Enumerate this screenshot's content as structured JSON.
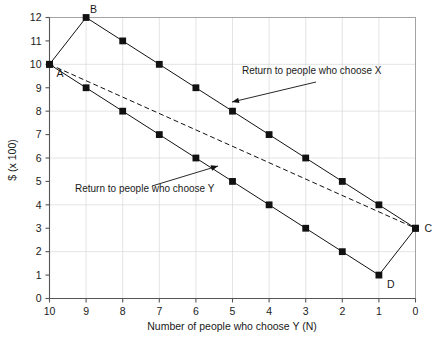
{
  "chart_data": {
    "type": "line",
    "title": "",
    "xlabel": "Number of people who choose Y (N)",
    "ylabel": "$ (x 100)",
    "xlim": [
      10,
      0
    ],
    "ylim": [
      0,
      12
    ],
    "x_ticks": [
      "10",
      "9",
      "8",
      "7",
      "6",
      "5",
      "4",
      "3",
      "2",
      "1",
      "0"
    ],
    "y_ticks": [
      "0",
      "1",
      "2",
      "3",
      "4",
      "5",
      "6",
      "7",
      "8",
      "9",
      "10",
      "11",
      "12"
    ],
    "x_axis_reversed": true,
    "grid": true,
    "legend_position": "none",
    "series": [
      {
        "name": "Return to people who choose X",
        "style": "solid",
        "marker": "square",
        "x": [
          10,
          9,
          8,
          7,
          6,
          5,
          4,
          3,
          2,
          1,
          0
        ],
        "values": [
          10,
          12,
          11,
          10,
          9,
          8,
          7,
          6,
          5,
          4,
          3
        ]
      },
      {
        "name": "Return to people who choose Y",
        "style": "solid",
        "marker": "square",
        "x": [
          10,
          9,
          8,
          7,
          6,
          5,
          4,
          3,
          2,
          1,
          0
        ],
        "values": [
          10,
          9,
          8,
          7,
          6,
          5,
          4,
          3,
          2,
          1,
          3
        ]
      },
      {
        "name": "Average return",
        "style": "dashed",
        "marker": "none",
        "x": [
          10,
          0
        ],
        "values": [
          10,
          3
        ]
      }
    ],
    "point_labels": [
      {
        "label": "A",
        "x": 10,
        "y": 10
      },
      {
        "label": "B",
        "x": 9,
        "y": 12
      },
      {
        "label": "C",
        "x": 0,
        "y": 3
      },
      {
        "label": "D",
        "x": 1,
        "y": 1
      }
    ],
    "annotations": [
      {
        "text": "Return to people who choose X",
        "text_x": 242,
        "text_y": 74,
        "arrow_from_x": 316,
        "arrow_from_y": 82,
        "arrow_to_x": 232,
        "arrow_to_y": 102
      },
      {
        "text": "Return to people who choose Y",
        "text_x": 75,
        "text_y": 192,
        "arrow_from_x": 152,
        "arrow_from_y": 186,
        "arrow_to_x": 218,
        "arrow_to_y": 166
      }
    ],
    "colors": {
      "line": "#111111",
      "grid": "#d8d8d8",
      "axis": "#555555",
      "background": "#ffffff",
      "border": "#9a9a9a"
    }
  }
}
